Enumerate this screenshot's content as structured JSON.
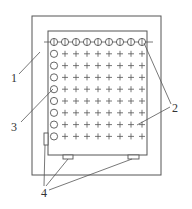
{
  "diagram": {
    "type": "technical-schematic",
    "colors": {
      "stroke": "#555555",
      "background": "#ffffff",
      "text": "#333333"
    },
    "outer_frame": {
      "x": 32,
      "y": 16,
      "width": 129,
      "height": 159
    },
    "inner_board": {
      "x": 48,
      "y": 31,
      "width": 99,
      "height": 124
    },
    "top_line": {
      "x1": 44,
      "x2": 153,
      "y": 42
    },
    "grid": {
      "columns": 9,
      "rows": 9,
      "x_start": 54,
      "x_step": 11,
      "y_start": 42,
      "y_step": 11.8,
      "top_row_marker": "circle-with-cross",
      "left_column_marker": "circle",
      "interior_marker": "plus"
    },
    "pads": [
      {
        "name": "left-pad",
        "x": 44,
        "y": 133,
        "width": 4,
        "height": 12
      },
      {
        "name": "bottom-pad-left",
        "x": 63,
        "y": 155,
        "width": 10,
        "height": 4
      },
      {
        "name": "bottom-pad-right",
        "x": 128,
        "y": 155,
        "width": 11,
        "height": 4
      }
    ],
    "labels": [
      {
        "id": "1",
        "text": "1",
        "x": 11,
        "y": 82
      },
      {
        "id": "2",
        "text": "2",
        "x": 172,
        "y": 112
      },
      {
        "id": "3",
        "text": "3",
        "x": 11,
        "y": 131
      },
      {
        "id": "4",
        "text": "4",
        "x": 41,
        "y": 197
      }
    ],
    "leaders": [
      {
        "label": "1",
        "x1": 19,
        "y1": 74,
        "x2": 40,
        "y2": 52
      },
      {
        "label": "2",
        "x1": 171,
        "y1": 104,
        "x2": 144,
        "y2": 43
      },
      {
        "label": "2",
        "x1": 170,
        "y1": 107,
        "x2": 137,
        "y2": 125
      },
      {
        "label": "3",
        "x1": 21,
        "y1": 122,
        "x2": 53,
        "y2": 89
      },
      {
        "label": "4",
        "x1": 44,
        "y1": 186,
        "x2": 45,
        "y2": 145
      },
      {
        "label": "4",
        "x1": 46,
        "y1": 186,
        "x2": 68,
        "y2": 159
      },
      {
        "label": "4",
        "x1": 49,
        "y1": 190,
        "x2": 132,
        "y2": 159
      }
    ]
  }
}
